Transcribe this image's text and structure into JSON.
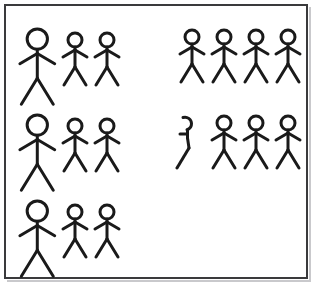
{
  "panel": {
    "title": "Stick figure group illustration",
    "background_color": "#ffffff",
    "border_color": "#3a3a3c",
    "shadow_color": "#c9c9cc",
    "stroke_color": "#1a1a1a",
    "width": 318,
    "height": 289
  },
  "figures": {
    "total_count": 17,
    "full_count": 16,
    "partial_count": 1,
    "large_count": 3,
    "small_count": 13
  },
  "groups": [
    {
      "name": "top-left-group",
      "row": 1,
      "column": "left",
      "count": 3,
      "members": [
        {
          "id": "figure-large-1",
          "size": "large",
          "state": "full",
          "x": 17,
          "y": 26,
          "scale": 1.45
        },
        {
          "id": "figure-small-1",
          "size": "small",
          "state": "full",
          "x": 61,
          "y": 31,
          "scale": 1.0
        },
        {
          "id": "figure-small-2",
          "size": "small",
          "state": "full",
          "x": 93,
          "y": 31,
          "scale": 1.0
        }
      ]
    },
    {
      "name": "top-right-group",
      "row": 1,
      "column": "right",
      "count": 4,
      "members": [
        {
          "id": "figure-small-3",
          "size": "small",
          "state": "full",
          "x": 178,
          "y": 28,
          "scale": 1.0
        },
        {
          "id": "figure-small-4",
          "size": "small",
          "state": "full",
          "x": 210,
          "y": 28,
          "scale": 1.0
        },
        {
          "id": "figure-small-5",
          "size": "small",
          "state": "full",
          "x": 242,
          "y": 28,
          "scale": 1.0
        },
        {
          "id": "figure-small-6",
          "size": "small",
          "state": "full",
          "x": 274,
          "y": 28,
          "scale": 1.0
        }
      ]
    },
    {
      "name": "middle-left-group",
      "row": 2,
      "column": "left",
      "count": 3,
      "members": [
        {
          "id": "figure-large-2",
          "size": "large",
          "state": "full",
          "x": 17,
          "y": 112,
          "scale": 1.45
        },
        {
          "id": "figure-small-7",
          "size": "small",
          "state": "full",
          "x": 61,
          "y": 117,
          "scale": 1.0
        },
        {
          "id": "figure-small-8",
          "size": "small",
          "state": "full",
          "x": 93,
          "y": 117,
          "scale": 1.0
        }
      ]
    },
    {
      "name": "middle-right-group",
      "row": 2,
      "column": "right",
      "count": 4,
      "members": [
        {
          "id": "figure-partial-1",
          "size": "small",
          "state": "partial",
          "x": 174,
          "y": 114,
          "scale": 1.0
        },
        {
          "id": "figure-small-9",
          "size": "small",
          "state": "full",
          "x": 210,
          "y": 114,
          "scale": 1.0
        },
        {
          "id": "figure-small-10",
          "size": "small",
          "state": "full",
          "x": 242,
          "y": 114,
          "scale": 1.0
        },
        {
          "id": "figure-small-11",
          "size": "small",
          "state": "full",
          "x": 274,
          "y": 114,
          "scale": 1.0
        }
      ]
    },
    {
      "name": "bottom-left-group",
      "row": 3,
      "column": "left",
      "count": 3,
      "members": [
        {
          "id": "figure-large-3",
          "size": "large",
          "state": "full",
          "x": 17,
          "y": 198,
          "scale": 1.45
        },
        {
          "id": "figure-small-12",
          "size": "small",
          "state": "full",
          "x": 61,
          "y": 203,
          "scale": 1.0
        },
        {
          "id": "figure-small-13",
          "size": "small",
          "state": "full",
          "x": 93,
          "y": 203,
          "scale": 1.0
        }
      ]
    },
    {
      "name": "bottom-right-group",
      "row": 3,
      "column": "right",
      "count": 0,
      "members": []
    }
  ],
  "figure_geometry": {
    "viewbox": "0 0 28 56",
    "head_cx": 14,
    "head_cy": 9,
    "head_r": 7,
    "body_top": 16,
    "body_bottom": 36,
    "arm_left_end_x": 2,
    "arm_left_end_y": 26,
    "arm_right_end_x": 26,
    "arm_right_end_y": 26,
    "arm_join_y": 19,
    "leg_left_end_x": 3,
    "leg_left_end_y": 54,
    "leg_right_end_x": 25,
    "leg_right_end_y": 54,
    "stroke_width": 3
  }
}
